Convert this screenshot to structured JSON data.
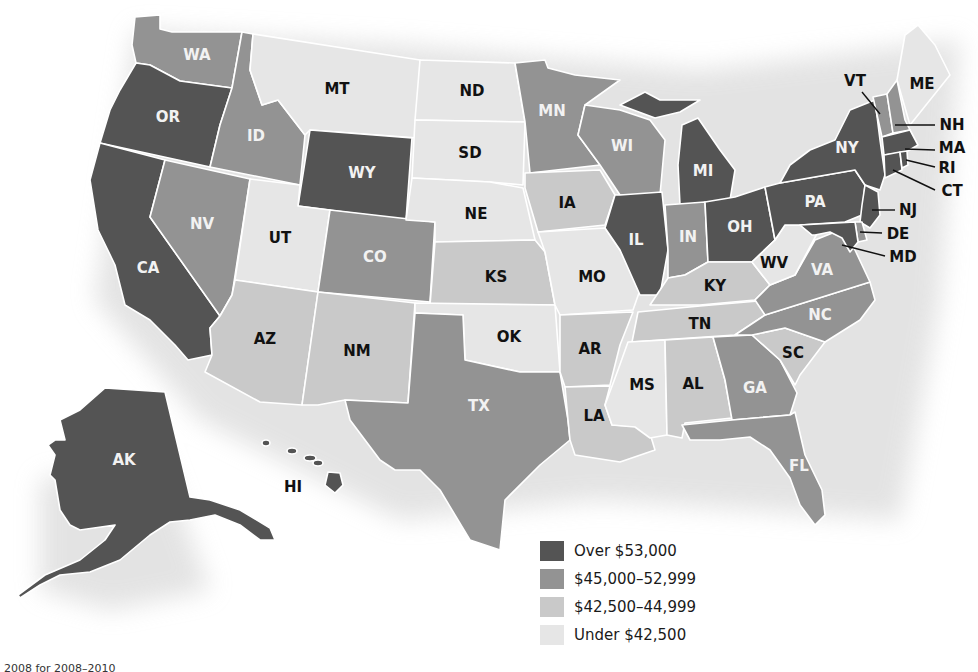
{
  "map": {
    "type": "choropleth",
    "subject": "Median household income by state"
  },
  "legend": {
    "items": [
      {
        "label": "Over $53,000",
        "color": "#545454",
        "class": "c1"
      },
      {
        "label": "$45,000–52,999",
        "color": "#939393",
        "class": "c2"
      },
      {
        "label": "$42,500–44,999",
        "color": "#c9c9c9",
        "class": "c3"
      },
      {
        "label": "Under $42,500",
        "color": "#e6e6e6",
        "class": "c4"
      }
    ]
  },
  "states": {
    "WA": "c2",
    "OR": "c1",
    "CA": "c1",
    "ID": "c2",
    "NV": "c2",
    "MT": "c4",
    "WY": "c1",
    "UT": "c4",
    "CO": "c2",
    "AZ": "c3",
    "NM": "c3",
    "ND": "c4",
    "SD": "c4",
    "NE": "c4",
    "KS": "c3",
    "OK": "c4",
    "TX": "c2",
    "MN": "c2",
    "IA": "c3",
    "MO": "c4",
    "AR": "c3",
    "LA": "c3",
    "WI": "c2",
    "IL": "c1",
    "MI": "c1",
    "IN": "c2",
    "OH": "c1",
    "KY": "c3",
    "TN": "c3",
    "MS": "c4",
    "AL": "c3",
    "GA": "c2",
    "FL": "c2",
    "SC": "c3",
    "NC": "c2",
    "VA": "c2",
    "WV": "c4",
    "PA": "c1",
    "NY": "c1",
    "VT": "c2",
    "NH": "c2",
    "ME": "c4",
    "MA": "c1",
    "RI": "c1",
    "CT": "c1",
    "NJ": "c1",
    "DE": "c2",
    "MD": "c1",
    "AK": "c1",
    "HI": "c1"
  },
  "labels": {
    "WA": "WA",
    "OR": "OR",
    "CA": "CA",
    "ID": "ID",
    "NV": "NV",
    "MT": "MT",
    "WY": "WY",
    "UT": "UT",
    "CO": "CO",
    "AZ": "AZ",
    "NM": "NM",
    "ND": "ND",
    "SD": "SD",
    "NE": "NE",
    "KS": "KS",
    "OK": "OK",
    "TX": "TX",
    "MN": "MN",
    "IA": "IA",
    "MO": "MO",
    "AR": "AR",
    "LA": "LA",
    "WI": "WI",
    "IL": "IL",
    "MI": "MI",
    "IN": "IN",
    "OH": "OH",
    "KY": "KY",
    "TN": "TN",
    "MS": "MS",
    "AL": "AL",
    "GA": "GA",
    "FL": "FL",
    "SC": "SC",
    "NC": "NC",
    "VA": "VA",
    "WV": "WV",
    "PA": "PA",
    "NY": "NY",
    "VT": "VT",
    "NH": "NH",
    "ME": "ME",
    "MA": "MA",
    "RI": "RI",
    "CT": "CT",
    "NJ": "NJ",
    "DE": "DE",
    "MD": "MD",
    "AK": "AK",
    "HI": "HI"
  },
  "footnote": "2008 for 2008–2010"
}
